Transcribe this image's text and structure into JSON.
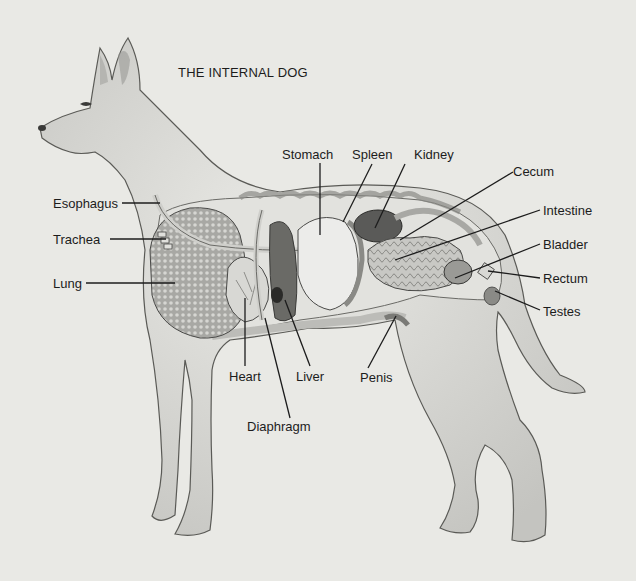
{
  "title": "THE INTERNAL DOG",
  "colors": {
    "background": "#e9e9e5",
    "ink": "#1c1c1c",
    "body_fill": "#e4e4e0",
    "body_shade": "#b8b8b4",
    "organ_light": "#dcdcd8",
    "organ_mid": "#9a9a96",
    "organ_dark": "#4a4a48"
  },
  "labels": {
    "stomach": "Stomach",
    "spleen": "Spleen",
    "kidney": "Kidney",
    "cecum": "Cecum",
    "esophagus": "Esophagus",
    "intestine": "Intestine",
    "trachea": "Trachea",
    "bladder": "Bladder",
    "lung": "Lung",
    "rectum": "Rectum",
    "testes": "Testes",
    "heart": "Heart",
    "liver": "Liver",
    "penis": "Penis",
    "diaphragm": "Diaphragm"
  }
}
